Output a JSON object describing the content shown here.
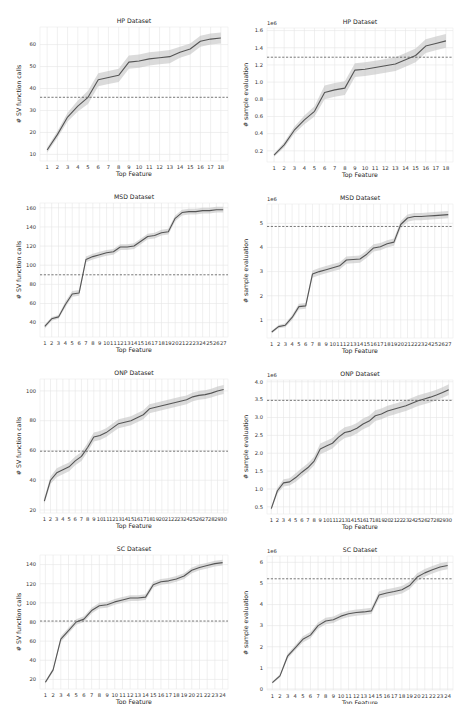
{
  "chart_data": [
    {
      "id": "hp-sv",
      "type": "line",
      "title": "HP Dataset",
      "xlabel": "Top Feature",
      "ylabel": "# SV function calls",
      "offset_label": "",
      "categories": [
        "1",
        "2",
        "3",
        "4",
        "5",
        "6",
        "7",
        "8",
        "9",
        "10",
        "11",
        "12",
        "13",
        "14",
        "15",
        "16",
        "17",
        "18"
      ],
      "values": [
        12,
        19,
        27,
        32,
        36,
        44,
        45,
        46,
        52,
        52.5,
        53.5,
        54,
        54.5,
        56.5,
        58,
        61.5,
        62.5,
        63
      ],
      "band": [
        1.2,
        1.5,
        2,
        2.5,
        3,
        3,
        3,
        3,
        3,
        3,
        3,
        3,
        3,
        2.5,
        2.5,
        2.5,
        2.5,
        2.5
      ],
      "baseline": 36,
      "ylim": [
        7,
        68
      ],
      "yticks": [
        10,
        20,
        30,
        40,
        50,
        60
      ],
      "ytick_labels": [
        "10",
        "20",
        "30",
        "40",
        "50",
        "60"
      ],
      "grid": true
    },
    {
      "id": "hp-sample",
      "type": "line",
      "title": "HP Dataset",
      "xlabel": "Top Feature",
      "ylabel": "# sample evaluation",
      "offset_label": "1e6",
      "categories": [
        "1",
        "2",
        "3",
        "4",
        "5",
        "6",
        "7",
        "8",
        "9",
        "10",
        "11",
        "12",
        "13",
        "14",
        "15",
        "16",
        "17",
        "18"
      ],
      "values": [
        0.15,
        0.27,
        0.44,
        0.56,
        0.66,
        0.88,
        0.91,
        0.93,
        1.14,
        1.15,
        1.17,
        1.19,
        1.21,
        1.26,
        1.31,
        1.42,
        1.45,
        1.48
      ],
      "band": [
        0.02,
        0.03,
        0.04,
        0.05,
        0.06,
        0.08,
        0.08,
        0.08,
        0.08,
        0.08,
        0.08,
        0.08,
        0.08,
        0.08,
        0.08,
        0.08,
        0.08,
        0.08
      ],
      "baseline": 1.29,
      "ylim": [
        0.07,
        1.63
      ],
      "yticks": [
        0.2,
        0.4,
        0.6,
        0.8,
        1.0,
        1.2,
        1.4,
        1.6
      ],
      "ytick_labels": [
        "0.2",
        "0.4",
        "0.6",
        "0.8",
        "1.0",
        "1.2",
        "1.4",
        "1.6"
      ],
      "grid": true
    },
    {
      "id": "msd-sv",
      "type": "line",
      "title": "MSD Dataset",
      "xlabel": "Top Feature",
      "ylabel": "# SV function calls",
      "offset_label": "",
      "categories": [
        "1",
        "2",
        "3",
        "4",
        "5",
        "6",
        "7",
        "8",
        "9",
        "10",
        "11",
        "12",
        "13",
        "14",
        "15",
        "16",
        "17",
        "18",
        "19",
        "20",
        "21",
        "22",
        "23",
        "24",
        "25",
        "26",
        "27"
      ],
      "values": [
        36,
        44,
        46,
        59,
        70,
        71,
        106,
        109,
        111,
        113,
        114,
        119,
        119,
        120,
        125,
        130,
        131,
        134,
        135,
        149,
        155,
        156,
        156,
        157,
        157,
        158,
        158
      ],
      "band": [
        2,
        2,
        2,
        3,
        3,
        3,
        3,
        3,
        3,
        3,
        3,
        3,
        3,
        3,
        3,
        3,
        3,
        3,
        3,
        3,
        3,
        3,
        3,
        3,
        3,
        3,
        3
      ],
      "baseline": 90,
      "ylim": [
        25,
        165
      ],
      "yticks": [
        40,
        60,
        80,
        100,
        120,
        140,
        160
      ],
      "ytick_labels": [
        "40",
        "60",
        "80",
        "100",
        "120",
        "140",
        "160"
      ],
      "grid": true
    },
    {
      "id": "msd-sample",
      "type": "line",
      "title": "MSD Dataset",
      "xlabel": "Top Feature",
      "ylabel": "# sample evaluation",
      "offset_label": "1e6",
      "categories": [
        "1",
        "2",
        "3",
        "4",
        "5",
        "6",
        "7",
        "8",
        "9",
        "10",
        "11",
        "12",
        "13",
        "14",
        "15",
        "16",
        "17",
        "18",
        "19",
        "20",
        "21",
        "22",
        "23",
        "24",
        "25",
        "26",
        "27"
      ],
      "values": [
        0.5,
        0.72,
        0.78,
        1.1,
        1.55,
        1.58,
        2.9,
        3.0,
        3.08,
        3.16,
        3.24,
        3.48,
        3.5,
        3.52,
        3.72,
        3.98,
        4.03,
        4.15,
        4.22,
        4.95,
        5.22,
        5.28,
        5.28,
        5.3,
        5.32,
        5.34,
        5.36
      ],
      "band": [
        0.05,
        0.07,
        0.08,
        0.1,
        0.12,
        0.12,
        0.15,
        0.15,
        0.15,
        0.15,
        0.15,
        0.15,
        0.15,
        0.15,
        0.15,
        0.15,
        0.15,
        0.15,
        0.15,
        0.15,
        0.15,
        0.15,
        0.15,
        0.15,
        0.15,
        0.15,
        0.15
      ],
      "baseline": 4.87,
      "ylim": [
        0.25,
        5.8
      ],
      "yticks": [
        1,
        2,
        3,
        4,
        5
      ],
      "ytick_labels": [
        "1",
        "2",
        "3",
        "4",
        "5"
      ],
      "grid": true
    },
    {
      "id": "onp-sv",
      "type": "line",
      "title": "ONP Dataset",
      "xlabel": "Top Feature",
      "ylabel": "# SV function calls",
      "offset_label": "",
      "categories": [
        "1",
        "2",
        "3",
        "4",
        "5",
        "6",
        "7",
        "8",
        "9",
        "10",
        "11",
        "12",
        "13",
        "14",
        "15",
        "16",
        "17",
        "18",
        "19",
        "20",
        "21",
        "22",
        "23",
        "24",
        "25",
        "26",
        "27",
        "28",
        "29",
        "30"
      ],
      "values": [
        26,
        40,
        45,
        47,
        49,
        53,
        56,
        62,
        69,
        70,
        72,
        75,
        78,
        79,
        80,
        82,
        84,
        88,
        89,
        90,
        91,
        92,
        93,
        94,
        96,
        97,
        97.5,
        98.5,
        100,
        101
      ],
      "band": [
        2,
        2.5,
        3,
        3,
        3,
        3,
        3,
        3,
        3,
        3,
        3,
        3,
        3,
        3,
        3,
        3,
        3,
        3,
        3,
        3,
        3,
        3,
        3,
        3,
        3,
        3,
        3,
        3,
        3,
        3
      ],
      "baseline": 59.5,
      "ylim": [
        18,
        108
      ],
      "yticks": [
        20,
        40,
        60,
        80,
        100
      ],
      "ytick_labels": [
        "20",
        "40",
        "60",
        "80",
        "100"
      ],
      "grid": true
    },
    {
      "id": "onp-sample",
      "type": "line",
      "title": "ONP Dataset",
      "xlabel": "Top Feature",
      "ylabel": "# sample evaluation",
      "offset_label": "1e6",
      "categories": [
        "1",
        "2",
        "3",
        "4",
        "5",
        "6",
        "7",
        "8",
        "9",
        "10",
        "11",
        "12",
        "13",
        "14",
        "15",
        "16",
        "17",
        "18",
        "19",
        "20",
        "21",
        "22",
        "23",
        "24",
        "25",
        "26",
        "27",
        "28",
        "29",
        "30"
      ],
      "values": [
        0.45,
        0.95,
        1.17,
        1.2,
        1.32,
        1.47,
        1.6,
        1.78,
        2.12,
        2.2,
        2.28,
        2.45,
        2.58,
        2.62,
        2.7,
        2.82,
        2.9,
        3.05,
        3.1,
        3.18,
        3.23,
        3.28,
        3.33,
        3.4,
        3.47,
        3.52,
        3.57,
        3.63,
        3.7,
        3.78
      ],
      "band": [
        0.05,
        0.08,
        0.1,
        0.1,
        0.12,
        0.12,
        0.12,
        0.12,
        0.15,
        0.15,
        0.15,
        0.15,
        0.15,
        0.15,
        0.15,
        0.15,
        0.15,
        0.15,
        0.15,
        0.15,
        0.15,
        0.15,
        0.15,
        0.15,
        0.15,
        0.15,
        0.15,
        0.15,
        0.15,
        0.15
      ],
      "baseline": 3.48,
      "ylim": [
        0.3,
        4.05
      ],
      "yticks": [
        0.5,
        1.0,
        1.5,
        2.0,
        2.5,
        3.0,
        3.5,
        4.0
      ],
      "ytick_labels": [
        "0.5",
        "1.0",
        "1.5",
        "2.0",
        "2.5",
        "3.0",
        "3.5",
        "4.0"
      ],
      "grid": true
    },
    {
      "id": "sc-sv",
      "type": "line",
      "title": "SC Dataset",
      "xlabel": "Top Feature",
      "ylabel": "# SV function calls",
      "offset_label": "",
      "categories": [
        "1",
        "2",
        "3",
        "4",
        "5",
        "6",
        "7",
        "8",
        "9",
        "10",
        "11",
        "12",
        "13",
        "14",
        "15",
        "16",
        "17",
        "18",
        "19",
        "20",
        "21",
        "22",
        "23",
        "24"
      ],
      "values": [
        17,
        30,
        62,
        71,
        80,
        83,
        92,
        97,
        98,
        101,
        103,
        105,
        105,
        106,
        119,
        122,
        123,
        125,
        128,
        134,
        137,
        139,
        141,
        142
      ],
      "band": [
        1.5,
        2,
        3,
        3,
        3,
        3,
        3,
        3,
        3,
        3,
        3,
        3,
        3,
        3,
        3,
        3,
        3,
        3,
        3,
        3,
        3,
        3,
        3,
        3
      ],
      "baseline": 81,
      "ylim": [
        10,
        150
      ],
      "yticks": [
        20,
        40,
        60,
        80,
        100,
        120,
        140
      ],
      "ytick_labels": [
        "20",
        "40",
        "60",
        "80",
        "100",
        "120",
        "140"
      ],
      "grid": true
    },
    {
      "id": "sc-sample",
      "type": "line",
      "title": "SC Dataset",
      "xlabel": "Top Feature",
      "ylabel": "# sample evaluation",
      "offset_label": "1e6",
      "categories": [
        "1",
        "2",
        "3",
        "4",
        "5",
        "6",
        "7",
        "8",
        "9",
        "10",
        "11",
        "12",
        "13",
        "14",
        "15",
        "16",
        "17",
        "18",
        "19",
        "20",
        "21",
        "22",
        "23",
        "24"
      ],
      "values": [
        0.3,
        0.62,
        1.55,
        1.95,
        2.35,
        2.55,
        3.0,
        3.22,
        3.28,
        3.45,
        3.56,
        3.62,
        3.65,
        3.7,
        4.45,
        4.55,
        4.62,
        4.7,
        4.9,
        5.3,
        5.5,
        5.65,
        5.78,
        5.85
      ],
      "band": [
        0.05,
        0.08,
        0.12,
        0.12,
        0.15,
        0.15,
        0.15,
        0.15,
        0.15,
        0.15,
        0.15,
        0.15,
        0.15,
        0.15,
        0.18,
        0.18,
        0.18,
        0.18,
        0.18,
        0.18,
        0.18,
        0.18,
        0.18,
        0.18
      ],
      "baseline": 5.22,
      "ylim": [
        -0.05,
        6.3
      ],
      "yticks": [
        0,
        1,
        2,
        3,
        4,
        5,
        6
      ],
      "ytick_labels": [
        "0",
        "1",
        "2",
        "3",
        "4",
        "5",
        "6"
      ],
      "grid": true
    }
  ]
}
